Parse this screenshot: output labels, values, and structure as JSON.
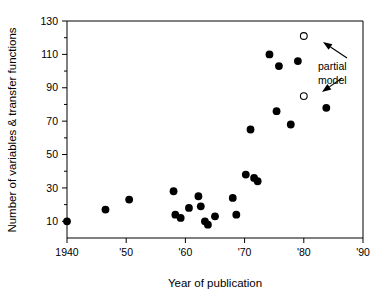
{
  "chart_data": {
    "type": "scatter",
    "title": "",
    "xlabel": "Year of publication",
    "ylabel": "Number of variables & transfer functions",
    "xlim": [
      1940,
      1990
    ],
    "ylim": [
      0,
      130
    ],
    "grid": false,
    "legend_position": "none",
    "xticks": [
      1940,
      1950,
      1960,
      1970,
      1980,
      1990
    ],
    "xticklabels": [
      "1940",
      "'50",
      "'60",
      "'70",
      "'80",
      "'90"
    ],
    "yticks": [
      10,
      30,
      50,
      70,
      90,
      110,
      130
    ],
    "yticklabels": [
      "10",
      "30",
      "50",
      "70",
      "90",
      "110",
      "130"
    ],
    "yticks_minor": [
      20,
      40,
      60,
      80,
      100,
      120
    ],
    "series": [
      {
        "name": "complete model",
        "marker": "filled-circle",
        "color": "#000000",
        "points": [
          [
            1940.0,
            10
          ],
          [
            1946.5,
            17
          ],
          [
            1950.5,
            23
          ],
          [
            1958.0,
            28
          ],
          [
            1958.3,
            14
          ],
          [
            1959.2,
            12
          ],
          [
            1960.6,
            18
          ],
          [
            1962.2,
            25
          ],
          [
            1962.6,
            19
          ],
          [
            1963.3,
            10
          ],
          [
            1963.8,
            8
          ],
          [
            1965.0,
            13
          ],
          [
            1968.0,
            24
          ],
          [
            1968.6,
            14
          ],
          [
            1970.2,
            38
          ],
          [
            1971.6,
            36
          ],
          [
            1972.2,
            34
          ],
          [
            1971.0,
            65
          ],
          [
            1974.2,
            110
          ],
          [
            1975.4,
            76
          ],
          [
            1975.8,
            103
          ],
          [
            1977.8,
            68
          ],
          [
            1979.0,
            106
          ],
          [
            1983.8,
            78
          ]
        ]
      },
      {
        "name": "partial model",
        "marker": "open-circle",
        "color": "#000000",
        "points": [
          [
            1980.0,
            121
          ],
          [
            1980.0,
            85
          ]
        ]
      }
    ],
    "annotations": [
      {
        "text_line1": "partial",
        "text_line2": "model",
        "text_x": 318,
        "text_y": 66,
        "arrows": [
          {
            "from_x": 347,
            "from_y": 58,
            "to_x": 323,
            "to_y": 42
          },
          {
            "from_x": 342,
            "from_y": 78,
            "to_x": 322,
            "to_y": 92
          }
        ]
      }
    ]
  },
  "annotation": {
    "partial_model_line1": "partial",
    "partial_model_line2": "model"
  }
}
